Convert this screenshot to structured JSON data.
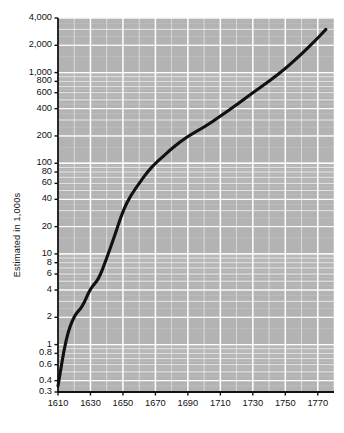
{
  "chart_data": {
    "type": "line",
    "title": "",
    "xlabel": "",
    "ylabel": "Estimated in 1,000s",
    "yscale": "log",
    "ylim": [
      0.3,
      4000
    ],
    "xlim": [
      1610,
      1780
    ],
    "grid": true,
    "legend": "none",
    "ytick_labels": [
      "4,000",
      "2,000",
      "1,000",
      "800",
      "600",
      "400",
      "200",
      "100",
      "80",
      "60",
      "40",
      "20",
      "10",
      "8",
      "6",
      "4",
      "2",
      "1",
      "0.8",
      "0.6",
      "0.4",
      "0.3"
    ],
    "ytick_values": [
      4000,
      2000,
      1000,
      800,
      600,
      400,
      200,
      100,
      80,
      60,
      40,
      20,
      10,
      8,
      6,
      4,
      2,
      1,
      0.8,
      0.6,
      0.4,
      0.3
    ],
    "xtick_labels": [
      "1610",
      "1630",
      "1650",
      "1670",
      "1690",
      "1710",
      "1730",
      "1750",
      "1770"
    ],
    "xtick_values": [
      1610,
      1630,
      1650,
      1670,
      1690,
      1710,
      1730,
      1750,
      1770
    ],
    "x": [
      1610,
      1615,
      1620,
      1625,
      1630,
      1635,
      1640,
      1645,
      1650,
      1655,
      1660,
      1665,
      1670,
      1675,
      1680,
      1690,
      1700,
      1710,
      1720,
      1730,
      1740,
      1750,
      1760,
      1770,
      1775
    ],
    "values": [
      0.35,
      1.2,
      2.1,
      2.6,
      4.2,
      5.2,
      9.0,
      16.0,
      30.0,
      45.0,
      60.0,
      80.0,
      100.0,
      120.0,
      145.0,
      200.0,
      250.0,
      330.0,
      440.0,
      600.0,
      800.0,
      1100.0,
      1600.0,
      2400.0,
      3000.0
    ],
    "series_name": "Estimated population",
    "line_color": "#111111",
    "plot_bg": "#b3b3b3",
    "grid_color": "#f2f2f2"
  },
  "axis": {
    "y_title": "Estimated in 1,000s"
  },
  "caption": {
    "text": ""
  }
}
